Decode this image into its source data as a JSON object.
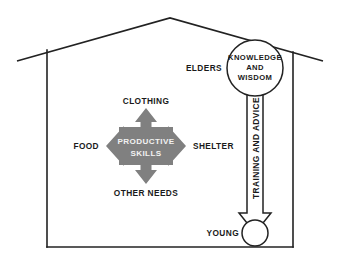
{
  "diagram": {
    "frame": {
      "name": "house-outline",
      "shape": "house",
      "roof_apex": [
        170,
        18
      ],
      "left_wall_x": 47,
      "right_wall_x": 293,
      "wall_top_y": 50,
      "floor_y": 247
    },
    "center_block": {
      "name": "productive-skills",
      "line1": "PRODUCTIVE",
      "line2": "SKILLS",
      "fill_color": "#808080",
      "text_color": "#f2f2f2"
    },
    "outputs": [
      {
        "id": "up",
        "label": "CLOTHING",
        "direction": "up"
      },
      {
        "id": "right",
        "label": "SHELTER",
        "direction": "right"
      },
      {
        "id": "down",
        "label": "OTHER NEEDS",
        "direction": "down"
      },
      {
        "id": "left",
        "label": "FOOD",
        "direction": "left"
      }
    ],
    "elders": {
      "side_label": "ELDERS",
      "circle_line1": "KNOWLEDGE",
      "circle_line2": "AND",
      "circle_line3": "WISDOM"
    },
    "young": {
      "side_label": "YOUNG"
    },
    "flow_arrow": {
      "label": "TRAINING AND ADVICE",
      "direction": "down",
      "from": "elders",
      "to": "young"
    },
    "colors": {
      "stroke": "#222222",
      "cross_fill": "#808080",
      "background": "#ffffff",
      "inner_text": "#f2f2f2"
    }
  }
}
